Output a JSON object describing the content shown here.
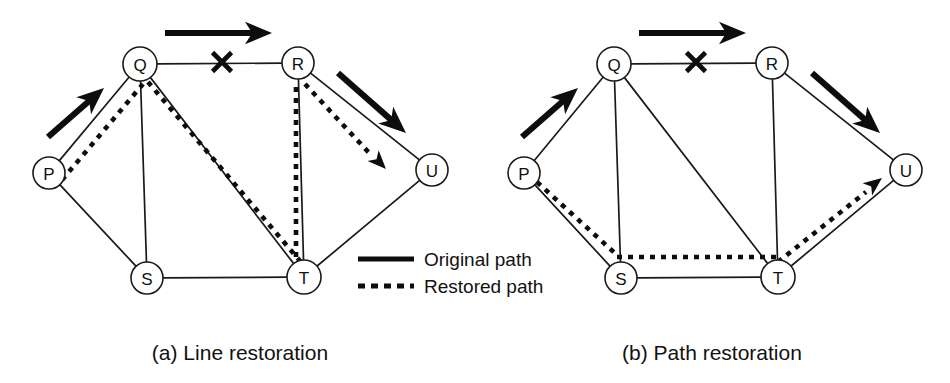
{
  "figure": {
    "background_color": "#ffffff",
    "ink_color": "#0d0d0d",
    "width": 950,
    "height": 383
  },
  "legend": {
    "original_label": "Original path",
    "restored_label": "Restored path"
  },
  "panels": [
    {
      "id": "panel-a",
      "caption": "(a) Line restoration",
      "caption_x": 240,
      "caption_y": 352,
      "nodes": [
        {
          "id": "P",
          "label": "P",
          "x": 49,
          "y": 173,
          "r": 16
        },
        {
          "id": "Q",
          "label": "Q",
          "x": 140,
          "y": 64,
          "r": 17
        },
        {
          "id": "R",
          "label": "R",
          "x": 298,
          "y": 63,
          "r": 16
        },
        {
          "id": "S",
          "label": "S",
          "x": 147,
          "y": 278,
          "r": 16
        },
        {
          "id": "T",
          "label": "T",
          "x": 304,
          "y": 277,
          "r": 17
        },
        {
          "id": "U",
          "label": "U",
          "x": 432,
          "y": 170,
          "r": 16
        }
      ],
      "edges": [
        {
          "from": "P",
          "to": "Q"
        },
        {
          "from": "Q",
          "to": "R"
        },
        {
          "from": "Q",
          "to": "S"
        },
        {
          "from": "Q",
          "to": "T"
        },
        {
          "from": "P",
          "to": "S"
        },
        {
          "from": "S",
          "to": "T"
        },
        {
          "from": "R",
          "to": "T"
        },
        {
          "from": "R",
          "to": "U"
        },
        {
          "from": "T",
          "to": "U"
        }
      ],
      "failure": {
        "x": 222,
        "y": 62,
        "size": 19
      },
      "restored_segments": [
        {
          "name": "restored-p-q",
          "points": "62,180 143,84"
        },
        {
          "name": "restored-q-t",
          "points": "148,82 311,274"
        },
        {
          "name": "restored-t-r",
          "points": "296,268 296,86"
        },
        {
          "name": "restored-r-u",
          "points": "305,84 372,156"
        }
      ],
      "restored_arrow": {
        "tip_x": 386,
        "tip_y": 169,
        "angle": 46
      },
      "flow_arrows": [
        {
          "name": "flow-arrow-pq",
          "x1": 48,
          "y1": 137,
          "x2": 104,
          "y2": 88
        },
        {
          "name": "flow-arrow-qr",
          "x1": 165,
          "y1": 33,
          "x2": 272,
          "y2": 33
        },
        {
          "name": "flow-arrow-ru",
          "x1": 338,
          "y1": 73,
          "x2": 406,
          "y2": 133
        }
      ]
    },
    {
      "id": "panel-b",
      "caption": "(b) Path restoration",
      "caption_x": 712,
      "caption_y": 352,
      "nodes": [
        {
          "id": "P",
          "label": "P",
          "x": 524,
          "y": 173,
          "r": 16
        },
        {
          "id": "Q",
          "label": "Q",
          "x": 614,
          "y": 64,
          "r": 17
        },
        {
          "id": "R",
          "label": "R",
          "x": 772,
          "y": 63,
          "r": 16
        },
        {
          "id": "S",
          "label": "S",
          "x": 621,
          "y": 278,
          "r": 16
        },
        {
          "id": "T",
          "label": "T",
          "x": 778,
          "y": 277,
          "r": 17
        },
        {
          "id": "U",
          "label": "U",
          "x": 906,
          "y": 170,
          "r": 16
        }
      ],
      "edges": [
        {
          "from": "P",
          "to": "Q"
        },
        {
          "from": "Q",
          "to": "R"
        },
        {
          "from": "Q",
          "to": "S"
        },
        {
          "from": "Q",
          "to": "T"
        },
        {
          "from": "P",
          "to": "S"
        },
        {
          "from": "S",
          "to": "T"
        },
        {
          "from": "R",
          "to": "T"
        },
        {
          "from": "R",
          "to": "U"
        },
        {
          "from": "T",
          "to": "U"
        }
      ],
      "failure": {
        "x": 696,
        "y": 62,
        "size": 19
      },
      "restored_segments": [
        {
          "name": "restored-p-s",
          "points": "537,182 618,256"
        },
        {
          "name": "restored-s-t",
          "points": "617,257 779,257"
        },
        {
          "name": "restored-t-u",
          "points": "778,262 866,192"
        }
      ],
      "restored_arrow": {
        "tip_x": 882,
        "tip_y": 178,
        "angle": -38
      },
      "flow_arrows": [
        {
          "name": "flow-arrow-pq",
          "x1": 522,
          "y1": 137,
          "x2": 578,
          "y2": 88
        },
        {
          "name": "flow-arrow-qr",
          "x1": 639,
          "y1": 33,
          "x2": 746,
          "y2": 33
        },
        {
          "name": "flow-arrow-ru",
          "x1": 812,
          "y1": 73,
          "x2": 880,
          "y2": 133
        }
      ]
    }
  ],
  "legend_box": {
    "x": 358,
    "y": 252,
    "sample_x1": 358,
    "sample_x2": 414,
    "solid_y": 259,
    "dashed_y": 286,
    "text_x": 424,
    "solid_text_y": 259,
    "dashed_text_y": 286
  }
}
